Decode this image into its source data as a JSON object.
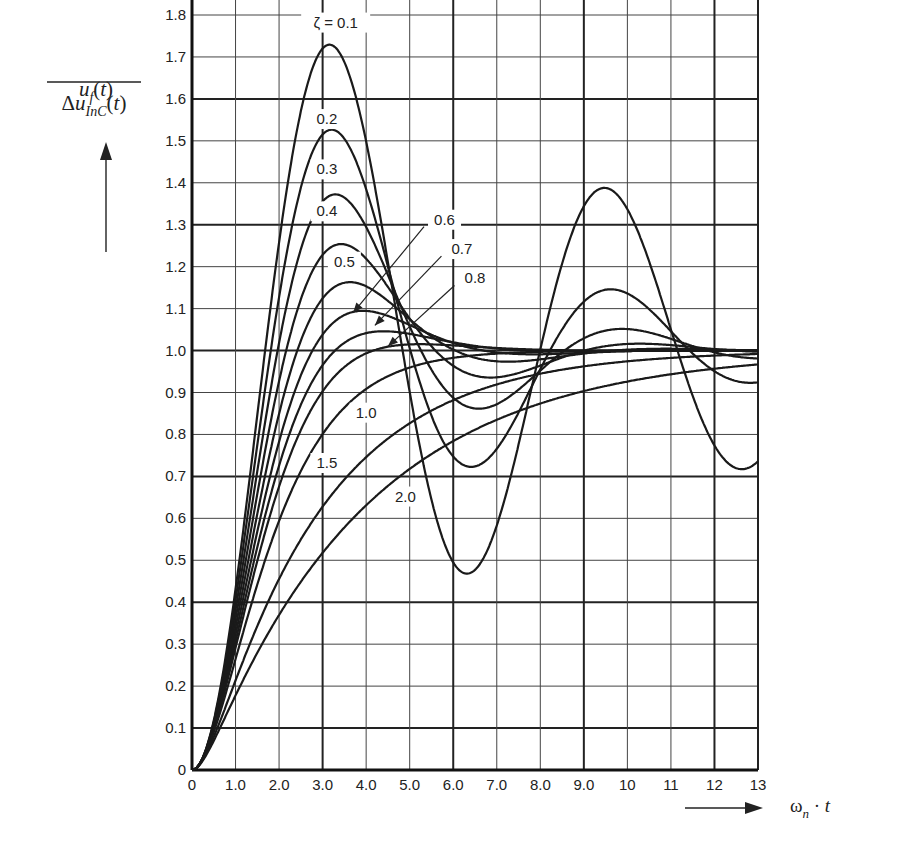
{
  "chart_data": {
    "type": "line",
    "title": "",
    "xlabel": "ωn · t",
    "ylabel": "u_f(t) / Δu_InC(t)",
    "xlim": [
      0,
      13
    ],
    "ylim": [
      0,
      1.8
    ],
    "grid": true,
    "x_ticks": [
      "0",
      "1.0",
      "2.0",
      "3.0",
      "4.0",
      "5.0",
      "6.0",
      "7.0",
      "8.0",
      "9.0",
      "10",
      "11",
      "12",
      "13"
    ],
    "y_ticks": [
      "0",
      "0.1",
      "0.2",
      "0.3",
      "0.4",
      "0.5",
      "0.6",
      "0.7",
      "0.8",
      "0.9",
      "1.0",
      "1.1",
      "1.2",
      "1.3",
      "1.4",
      "1.5",
      "1.6",
      "1.7",
      "1.8"
    ],
    "series": [
      {
        "name": "ζ = 0.1",
        "zeta": 0.1,
        "peak": {
          "x": 3.15,
          "y": 1.73
        },
        "x": [
          0,
          1,
          2,
          3,
          4,
          5,
          6,
          7,
          8,
          9,
          10,
          11,
          12,
          13
        ],
        "values": [
          0,
          0.46,
          1.34,
          1.73,
          1.45,
          0.8,
          0.53,
          0.81,
          1.19,
          1.36,
          1.23,
          0.94,
          0.77,
          0.8
        ]
      },
      {
        "name": "0.2",
        "zeta": 0.2,
        "peak": {
          "x": 3.2,
          "y": 1.53
        },
        "x": [
          0,
          1,
          2,
          3,
          4,
          5,
          6,
          7,
          8,
          9,
          10,
          11,
          12,
          13
        ],
        "values": [
          0,
          0.44,
          1.24,
          1.52,
          1.22,
          0.85,
          0.79,
          0.98,
          1.13,
          1.11,
          1.01,
          0.96,
          0.97,
          1.01
        ]
      },
      {
        "name": "0.3",
        "zeta": 0.3,
        "peak": {
          "x": 3.3,
          "y": 1.37
        },
        "x": [
          0,
          1,
          2,
          3,
          4,
          5,
          6,
          7,
          8,
          9,
          10,
          11,
          12,
          13
        ],
        "values": [
          0,
          0.42,
          1.15,
          1.37,
          1.18,
          0.93,
          0.91,
          1.01,
          1.05,
          1.02,
          0.99,
          0.99,
          1.0,
          1.0
        ]
      },
      {
        "name": "0.4",
        "zeta": 0.4,
        "peak": {
          "x": 3.4,
          "y": 1.25
        },
        "x": [
          0,
          1,
          2,
          3,
          4,
          5,
          6,
          7,
          8,
          9,
          10,
          11,
          12,
          13
        ],
        "values": [
          0,
          0.4,
          1.06,
          1.25,
          1.14,
          0.98,
          0.97,
          1.0,
          1.01,
          1.0,
          1.0,
          1.0,
          1.0,
          1.0
        ]
      },
      {
        "name": "0.5",
        "zeta": 0.5,
        "peak": {
          "x": 3.6,
          "y": 1.16
        },
        "x": [
          0,
          1,
          2,
          3,
          4,
          5,
          6,
          7,
          8,
          9,
          10,
          11,
          12,
          13
        ],
        "values": [
          0,
          0.37,
          0.98,
          1.16,
          1.1,
          1.01,
          0.99,
          1.0,
          1.0,
          1.0,
          1.0,
          1.0,
          1.0,
          1.0
        ]
      },
      {
        "name": "0.6",
        "zeta": 0.6,
        "peak": {
          "x": 3.9,
          "y": 1.09
        },
        "x": [
          0,
          1,
          2,
          3,
          4,
          5,
          6,
          7,
          8,
          9,
          10,
          11,
          12,
          13
        ],
        "values": [
          0,
          0.35,
          0.91,
          1.07,
          1.08,
          1.02,
          1.0,
          1.0,
          1.0,
          1.0,
          1.0,
          1.0,
          1.0,
          1.0
        ]
      },
      {
        "name": "0.7",
        "zeta": 0.7,
        "peak": {
          "x": 4.4,
          "y": 1.05
        },
        "x": [
          0,
          1,
          2,
          3,
          4,
          5,
          6,
          7,
          8,
          9,
          10,
          11,
          12,
          13
        ],
        "values": [
          0,
          0.33,
          0.83,
          1.02,
          1.04,
          1.02,
          1.01,
          1.0,
          1.0,
          1.0,
          1.0,
          1.0,
          1.0,
          1.0
        ]
      },
      {
        "name": "0.8",
        "zeta": 0.8,
        "peak": {
          "x": 5.2,
          "y": 1.02
        },
        "x": [
          0,
          1,
          2,
          3,
          4,
          5,
          6,
          7,
          8,
          9,
          10,
          11,
          12,
          13
        ],
        "values": [
          0,
          0.31,
          0.77,
          0.96,
          1.01,
          1.01,
          1.01,
          1.0,
          1.0,
          1.0,
          1.0,
          1.0,
          1.0,
          1.0
        ]
      },
      {
        "name": "1.0",
        "zeta": 1.0,
        "x": [
          0,
          1,
          2,
          3,
          4,
          5,
          6,
          7,
          8,
          9,
          10,
          11,
          12,
          13
        ],
        "values": [
          0,
          0.26,
          0.59,
          0.8,
          0.91,
          0.96,
          0.98,
          0.99,
          1.0,
          1.0,
          1.0,
          1.0,
          1.0,
          1.0
        ]
      },
      {
        "name": "1.5",
        "zeta": 1.5,
        "x": [
          0,
          1,
          2,
          3,
          4,
          5,
          6,
          7,
          8,
          9,
          10,
          11,
          12,
          13
        ],
        "values": [
          0,
          0.22,
          0.48,
          0.65,
          0.77,
          0.85,
          0.9,
          0.93,
          0.95,
          0.97,
          0.98,
          0.99,
          0.99,
          0.99
        ]
      },
      {
        "name": "2.0",
        "zeta": 2.0,
        "x": [
          0,
          1,
          2,
          3,
          4,
          5,
          6,
          7,
          8,
          9,
          10,
          11,
          12,
          13
        ],
        "values": [
          0,
          0.18,
          0.39,
          0.55,
          0.66,
          0.75,
          0.81,
          0.86,
          0.89,
          0.92,
          0.94,
          0.95,
          0.96,
          0.97
        ]
      }
    ],
    "annotations": [
      {
        "text": "ζ = 0.1",
        "x": 3.3,
        "y": 1.77
      },
      {
        "text": "0.2",
        "x": 3.1,
        "y": 1.54
      },
      {
        "text": "0.3",
        "x": 3.1,
        "y": 1.42
      },
      {
        "text": "0.4",
        "x": 3.1,
        "y": 1.32
      },
      {
        "text": "0.5",
        "x": 3.5,
        "y": 1.2
      },
      {
        "text": "0.6",
        "x": 5.8,
        "y": 1.3,
        "arrow_to": {
          "x": 3.7,
          "y": 1.09
        }
      },
      {
        "text": "0.7",
        "x": 6.2,
        "y": 1.23,
        "arrow_to": {
          "x": 4.2,
          "y": 1.06
        }
      },
      {
        "text": "0.8",
        "x": 6.5,
        "y": 1.16,
        "arrow_to": {
          "x": 4.5,
          "y": 1.01
        }
      },
      {
        "text": "1.0",
        "x": 4.0,
        "y": 0.84
      },
      {
        "text": "1.5",
        "x": 3.1,
        "y": 0.72
      },
      {
        "text": "2.0",
        "x": 4.9,
        "y": 0.64
      }
    ]
  },
  "axes": {
    "y_label_num": "u_f(t)",
    "y_label_den": "ΔuInC(t)",
    "x_label": "ωn · t"
  },
  "layout": {
    "x0": 192,
    "x1": 758,
    "y0": 770,
    "y1": 15
  }
}
